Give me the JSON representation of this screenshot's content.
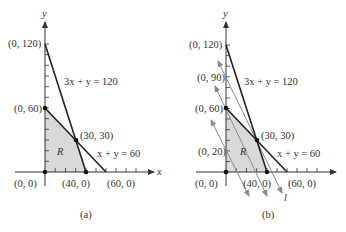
{
  "panels": [
    {
      "id": "a",
      "caption": "(a)",
      "axis_labels": {
        "x": "x",
        "y": "y"
      },
      "points": {
        "p0_120": "(0, 120)",
        "p0_60": "(0, 60)",
        "p30_30": "(30, 30)",
        "p0_0": "(0, 0)",
        "p40_0": "(40, 0)",
        "p60_0": "(60, 0)"
      },
      "equations": {
        "line1": "3x + y = 120",
        "line2": "x + y = 60"
      },
      "region_label": "R"
    },
    {
      "id": "b",
      "caption": "(b)",
      "axis_labels": {
        "y": "y"
      },
      "points": {
        "p0_120": "(0, 120)",
        "p0_90": "(0, 90)",
        "p0_60": "(0, 60)",
        "p0_20": "(0, 20)",
        "p30_30": "(30, 30)",
        "p0_0": "(0, 0)",
        "p40_0": "(40, 0)",
        "p60_0": "(60, 0)"
      },
      "equations": {
        "line1": "3x + y = 120",
        "line2": "x + y = 60"
      },
      "region_label": "R",
      "line_label": "l"
    }
  ],
  "colors": {
    "region_fill": "#d9d9d9",
    "constraint_line": "#222222",
    "isoprofit_line": "#8a8a8a",
    "axis": "#333333"
  }
}
